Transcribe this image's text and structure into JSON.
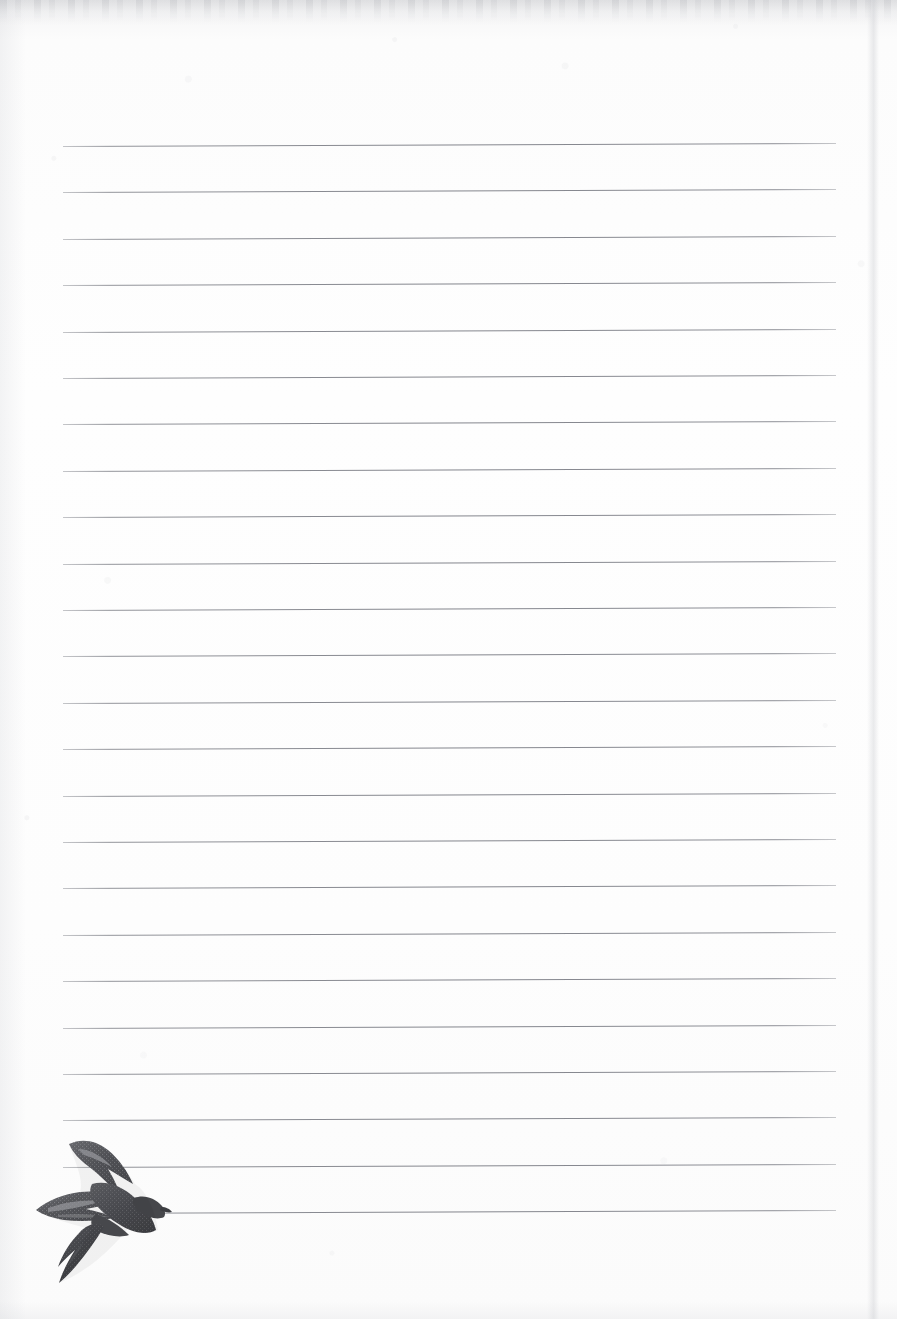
{
  "page": {
    "kind": "ruled-notebook-page",
    "width": 897,
    "height": 1319,
    "paper_color": "#fdfdfd",
    "paper_edge_color": "#c6c8ce",
    "content_text": ""
  },
  "ruling": {
    "line_count": 24,
    "first_line_y": 146,
    "line_spacing": 46.4,
    "line_left_x": 63,
    "line_right_x": 836,
    "line_thickness": 1,
    "line_color": "#7a7c84",
    "slant_degrees": -0.22,
    "label": "ruled lines"
  },
  "illustration": {
    "name": "swift-bird",
    "label": "Swift in flight",
    "body_color": "#4e4e52",
    "wing_color": "#5f6065",
    "highlight_color": "#8d8e93",
    "x": 22,
    "y": 1122,
    "width": 150,
    "height": 175
  }
}
